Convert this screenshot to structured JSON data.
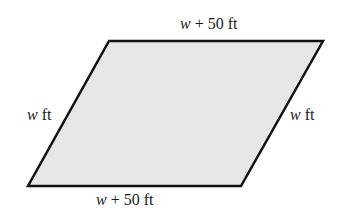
{
  "diagram": {
    "shape": "parallelogram",
    "fill_color": "#e6e6e6",
    "stroke_color": "#111111",
    "labels": {
      "top": {
        "var": "w",
        "rest": " + 50 ft"
      },
      "bottom": {
        "var": "w",
        "rest": " + 50 ft"
      },
      "left": {
        "var": "w",
        "rest": " ft"
      },
      "right": {
        "var": "w",
        "rest": " ft"
      }
    }
  }
}
